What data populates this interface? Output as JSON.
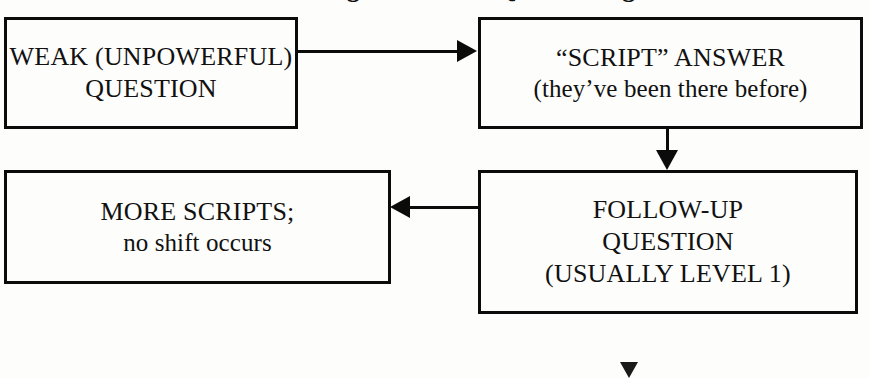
{
  "diagram": {
    "title_remnant": "The Dialogue of Weak Questioning",
    "background_color": "#fdfdfb",
    "line_color": "#0b0b0b",
    "text_color": "#111111",
    "nodes": [
      {
        "id": "weak-question",
        "line1": "WEAK (UNPOWERFUL)",
        "line2": "QUESTION"
      },
      {
        "id": "script-answer",
        "line1": "“SCRIPT” ANSWER",
        "line2": "(they’ve been there before)"
      },
      {
        "id": "more-scripts",
        "line1": "MORE SCRIPTS;",
        "line2": "no shift occurs"
      },
      {
        "id": "followup-question",
        "line1": "FOLLOW-UP",
        "line2": "QUESTION",
        "line3": "(USUALLY LEVEL 1)"
      }
    ],
    "connectors": [
      {
        "id": "weak-to-script",
        "direction": "right",
        "from": "weak-question",
        "to": "script-answer"
      },
      {
        "id": "script-to-followup",
        "direction": "down",
        "from": "script-answer",
        "to": "followup-question"
      },
      {
        "id": "followup-to-more",
        "direction": "left",
        "from": "followup-question",
        "to": "more-scripts"
      }
    ]
  }
}
